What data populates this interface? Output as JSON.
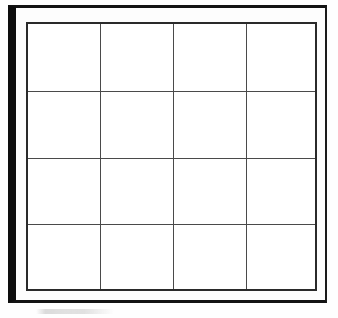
{
  "document": {
    "title": "Blank 4 by 4 Grid Board",
    "description": "Scanned line drawing of an empty rectangular board framed by a heavy black border and divided into a four-by-four grid of blank cells.",
    "background_color": "#ffffff",
    "paper_color": "#fdfdfd"
  },
  "frame": {
    "name": "outer frame",
    "border_color_heavy": "#0d0d0d",
    "border_color_thin": "#1a1a1a",
    "thick_edges": "left, top",
    "thin_edges": "right, bottom"
  },
  "board": {
    "name": "grid board",
    "border_color": "#2a2a2a",
    "line_color": "#4a4a4a",
    "rows": 4,
    "columns": 4,
    "cell_count": 16,
    "cells": [
      {
        "row": 1,
        "column": 1,
        "label": ""
      },
      {
        "row": 1,
        "column": 2,
        "label": ""
      },
      {
        "row": 1,
        "column": 3,
        "label": ""
      },
      {
        "row": 1,
        "column": 4,
        "label": ""
      },
      {
        "row": 2,
        "column": 1,
        "label": ""
      },
      {
        "row": 2,
        "column": 2,
        "label": ""
      },
      {
        "row": 2,
        "column": 3,
        "label": ""
      },
      {
        "row": 2,
        "column": 4,
        "label": ""
      },
      {
        "row": 3,
        "column": 1,
        "label": ""
      },
      {
        "row": 3,
        "column": 2,
        "label": ""
      },
      {
        "row": 3,
        "column": 3,
        "label": ""
      },
      {
        "row": 3,
        "column": 4,
        "label": ""
      },
      {
        "row": 4,
        "column": 1,
        "label": ""
      },
      {
        "row": 4,
        "column": 2,
        "label": ""
      },
      {
        "row": 4,
        "column": 3,
        "label": ""
      },
      {
        "row": 4,
        "column": 4,
        "label": ""
      }
    ]
  },
  "artifacts": {
    "smudge": {
      "name": "scan smudge",
      "text": "",
      "color": "#8c8c8c"
    }
  }
}
